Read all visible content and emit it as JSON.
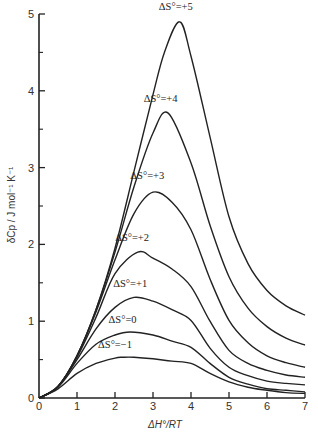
{
  "chart_data": {
    "type": "line",
    "title": "",
    "xlabel": "ΔH°/RT",
    "ylabel": "δCp / J mol⁻¹ K⁻¹",
    "xlim": [
      0,
      7
    ],
    "ylim": [
      0,
      5
    ],
    "xticks": [
      0,
      1,
      2,
      3,
      4,
      5,
      6,
      7
    ],
    "yticks": [
      0,
      1,
      2,
      3,
      4,
      5
    ],
    "yminor_ticks": [
      0.5,
      1.5,
      2.5,
      3.5,
      4.5
    ],
    "grid": false,
    "legend": "inline labels above each curve peak",
    "series": [
      {
        "name": "ΔS°=+5",
        "label_at": [
          3.6,
          5.05
        ],
        "x": [
          0,
          0.5,
          1,
          1.5,
          2,
          2.5,
          3,
          3.3,
          3.7,
          4,
          4.5,
          5,
          5.5,
          6,
          6.5,
          7
        ],
        "y": [
          0,
          0.15,
          0.55,
          1.15,
          1.95,
          2.95,
          3.95,
          4.5,
          4.9,
          4.45,
          3.4,
          2.36,
          1.75,
          1.4,
          1.2,
          1.08
        ]
      },
      {
        "name": "ΔS°=+4",
        "label_at": [
          3.2,
          3.85
        ],
        "x": [
          0,
          0.5,
          1,
          1.5,
          2,
          2.5,
          3,
          3.4,
          4,
          4.5,
          5,
          5.5,
          6,
          6.5,
          7
        ],
        "y": [
          0,
          0.15,
          0.55,
          1.15,
          1.9,
          2.75,
          3.45,
          3.71,
          3.06,
          2.25,
          1.58,
          1.17,
          0.93,
          0.78,
          0.69
        ]
      },
      {
        "name": "ΔS°=+3",
        "label_at": [
          2.85,
          2.85
        ],
        "x": [
          0,
          0.5,
          1,
          1.5,
          2,
          2.5,
          3,
          3.5,
          4,
          4.5,
          5,
          5.5,
          6,
          6.5,
          7
        ],
        "y": [
          0,
          0.15,
          0.55,
          1.12,
          1.8,
          2.4,
          2.68,
          2.55,
          2.19,
          1.55,
          1.01,
          0.72,
          0.55,
          0.46,
          0.4
        ]
      },
      {
        "name": "ΔS°=+2",
        "label_at": [
          2.45,
          2.05
        ],
        "x": [
          0,
          0.5,
          1,
          1.5,
          2,
          2.6,
          3,
          3.5,
          4,
          4.5,
          5,
          5.5,
          6,
          6.5,
          7
        ],
        "y": [
          0,
          0.15,
          0.53,
          1.05,
          1.62,
          1.9,
          1.82,
          1.68,
          1.45,
          1.0,
          0.62,
          0.45,
          0.36,
          0.3,
          0.27
        ]
      },
      {
        "name": "ΔS°=+1",
        "label_at": [
          2.4,
          1.45
        ],
        "x": [
          0,
          0.5,
          1,
          1.5,
          2,
          2.5,
          3,
          3.5,
          4,
          4.5,
          5,
          5.5,
          6,
          6.5,
          7
        ],
        "y": [
          0,
          0.15,
          0.5,
          0.9,
          1.18,
          1.31,
          1.26,
          1.15,
          1.01,
          0.65,
          0.4,
          0.29,
          0.22,
          0.19,
          0.17
        ]
      },
      {
        "name": "ΔS°=0",
        "label_at": [
          2.2,
          0.98
        ],
        "x": [
          0,
          0.5,
          1,
          1.5,
          2,
          2.4,
          3,
          3.5,
          4,
          4.5,
          5,
          5.5,
          6,
          6.5,
          7
        ],
        "y": [
          0,
          0.14,
          0.45,
          0.7,
          0.82,
          0.86,
          0.82,
          0.74,
          0.66,
          0.45,
          0.27,
          0.18,
          0.12,
          0.1,
          0.08
        ]
      },
      {
        "name": "ΔS°=−1",
        "label_at": [
          2.0,
          0.65
        ],
        "x": [
          0,
          0.5,
          1,
          1.5,
          2,
          2.2,
          2.5,
          3,
          3.5,
          4,
          4.5,
          5,
          5.5,
          6,
          6.5,
          7
        ],
        "y": [
          0,
          0.12,
          0.32,
          0.45,
          0.52,
          0.53,
          0.53,
          0.51,
          0.48,
          0.45,
          0.32,
          0.21,
          0.14,
          0.1,
          0.07,
          0.06
        ]
      }
    ]
  },
  "plot": {
    "origin_label": "0",
    "axis_color": "#222222",
    "line_color": "#222222",
    "background": "#ffffff"
  }
}
